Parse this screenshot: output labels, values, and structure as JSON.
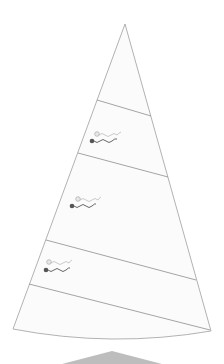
{
  "diagram": {
    "title": "",
    "colors": {
      "background": "#ffffff",
      "sail_fill": "#fbfbfb",
      "sail_outline": "#a9a9a9",
      "seam_line": "#9a9a9a",
      "telltale_windward": "#555555",
      "telltale_leeward": "#aaaaaa",
      "boom_shape": "#bdbdbd"
    },
    "sail": {
      "head": [
        125,
        24
      ],
      "seams": [
        {
          "from": [
            97,
            100
          ],
          "to": [
            151,
            116
          ]
        },
        {
          "from": [
            78,
            153
          ],
          "to": [
            168,
            177
          ]
        },
        {
          "from": [
            46,
            240
          ],
          "to": [
            196,
            280
          ]
        },
        {
          "from": [
            29,
            284
          ],
          "to": [
            210,
            330
          ]
        }
      ],
      "tack": [
        13,
        329
      ],
      "clew": [
        211,
        331
      ]
    },
    "telltales": [
      {
        "name": "upper",
        "leeward_dot": [
          97,
          134
        ],
        "windward_dot": [
          92,
          141
        ]
      },
      {
        "name": "middle",
        "leeward_dot": [
          78,
          199
        ],
        "windward_dot": [
          72,
          206
        ]
      },
      {
        "name": "lower",
        "leeward_dot": [
          49,
          262
        ],
        "windward_dot": [
          46,
          270
        ]
      }
    ],
    "boom_shape": {
      "peak": [
        112,
        351
      ],
      "base_left": [
        62,
        364
      ],
      "base_right": [
        162,
        364
      ]
    }
  }
}
